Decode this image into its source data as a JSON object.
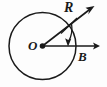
{
  "figure": {
    "type": "geometry-diagram",
    "background_color": "#fdfdfd",
    "stroke_color": "#1a1a1a",
    "labels": {
      "center": "O",
      "radius": "R",
      "field": "B"
    },
    "geometry": {
      "circle": {
        "cx": 42.5,
        "cy": 46,
        "r": 33.5
      },
      "center_dot": {
        "cx": 42.5,
        "cy": 46,
        "r": 2.6
      },
      "radius_vector": {
        "from": [
          42.5,
          46
        ],
        "to": [
          93,
          7
        ],
        "label": "R",
        "has_arrowhead": true
      },
      "field_vector": {
        "from": [
          42.5,
          46
        ],
        "to": [
          99,
          46
        ],
        "label": "B",
        "has_arrowhead": true
      },
      "angle_arc": {
        "from": [
          70,
          24
        ],
        "to": [
          68,
          45
        ],
        "has_arrowhead": true,
        "direction": "clockwise-down"
      },
      "tick_mark": {
        "from": [
          62,
          33
        ],
        "to": [
          76,
          19
        ]
      }
    }
  }
}
